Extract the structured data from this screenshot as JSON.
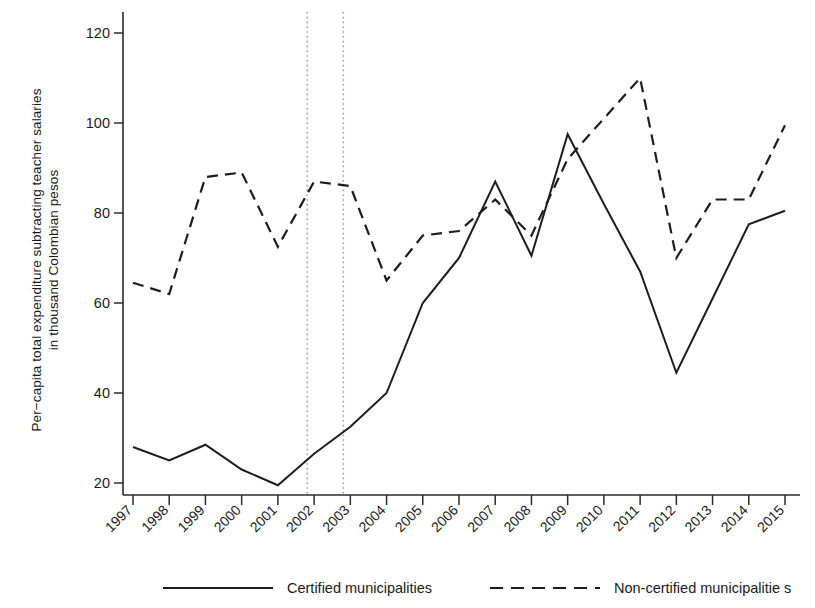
{
  "chart_data": {
    "type": "line",
    "title": "",
    "xlabel": "",
    "ylabel": "Per−capita total expenditure subtracting teacher salaries",
    "ylabel_line2": "in thousand Colombian pesos",
    "x": [
      1997,
      1998,
      1999,
      2000,
      2001,
      2002,
      2003,
      2004,
      2005,
      2006,
      2007,
      2008,
      2009,
      2010,
      2011,
      2012,
      2013,
      2014,
      2015
    ],
    "categories": [
      "1997",
      "1998",
      "1999",
      "2000",
      "2001",
      "2002",
      "2003",
      "2004",
      "2005",
      "2006",
      "2007",
      "2008",
      "2009",
      "2010",
      "2011",
      "2012",
      "2013",
      "2014",
      "2015"
    ],
    "xlim": [
      1997,
      2015
    ],
    "ylim": [
      18,
      122
    ],
    "yticks": [
      20,
      40,
      60,
      80,
      100,
      120
    ],
    "ytick_labels": [
      "20",
      "40",
      "60",
      "80",
      "100",
      "120"
    ],
    "grid": false,
    "legend_position": "bottom",
    "series": [
      {
        "name": "Certified municipalities",
        "style": "solid",
        "color": "#1d1d1d",
        "values": [
          28,
          25,
          28.5,
          23,
          19.5,
          26.5,
          32.5,
          40,
          60,
          70,
          87,
          70.5,
          97.5,
          82,
          67,
          44.5,
          61,
          77.5,
          80.5
        ]
      },
      {
        "name": "Non-certified municipalitie s",
        "style": "dashed",
        "color": "#1d1d1d",
        "values": [
          64.5,
          62,
          88,
          89,
          72.5,
          87,
          86,
          65,
          75,
          76,
          83,
          75,
          92,
          101,
          110,
          70,
          83,
          83,
          99.5
        ]
      }
    ],
    "annotations": {
      "vertical_reference_lines": [
        {
          "name": "reform-start-line",
          "x": 2002,
          "style": "dotted",
          "color": "#9a9a9a"
        },
        {
          "name": "reform-end-line",
          "x": 2003,
          "style": "dotted",
          "color": "#9a9a9a"
        }
      ]
    }
  },
  "legend": {
    "items": [
      {
        "label": "Certified municipalities",
        "style": "solid"
      },
      {
        "label": "Non-certified municipalitie s",
        "style": "dashed"
      }
    ]
  }
}
